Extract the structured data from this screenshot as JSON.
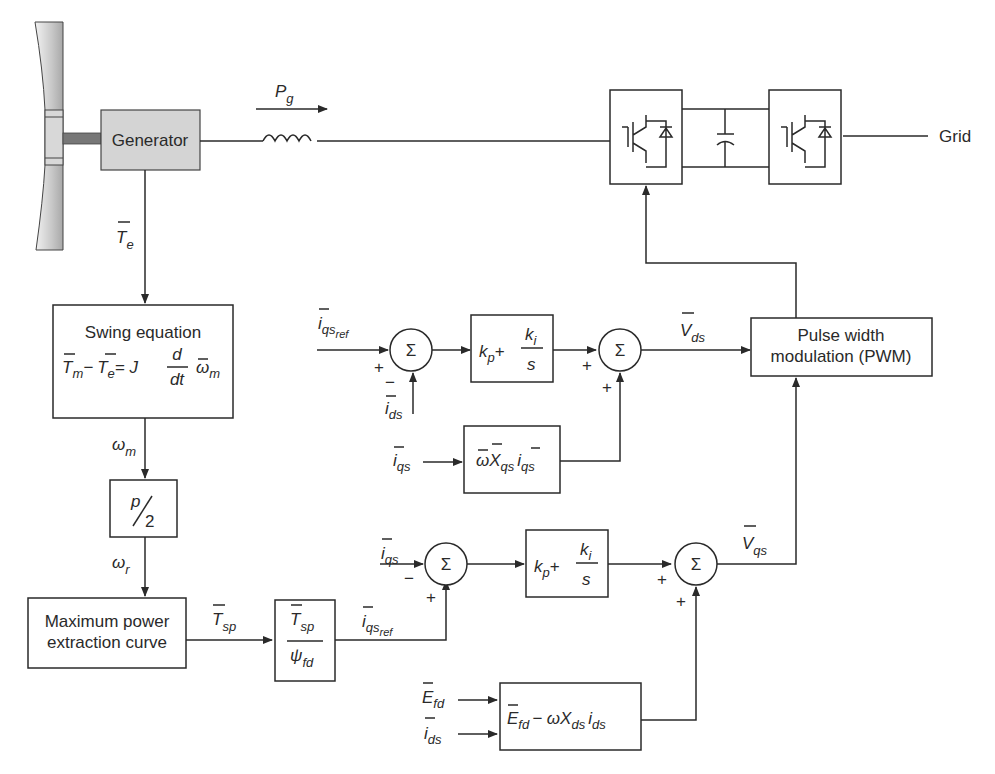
{
  "diagram": {
    "blocks": {
      "generator": "Generator",
      "swing_title": "Swing equation",
      "pole_ratio_num": "p",
      "pole_ratio_den": "2",
      "mppt_line1": "Maximum power",
      "mppt_line2": "extraction curve",
      "pwm_line1": "Pulse width",
      "pwm_line2": "modulation (PWM)",
      "grid": "Grid",
      "sum_symbol": "Σ"
    },
    "signals": {
      "pg": "P",
      "pg_sub": "g",
      "te": "T",
      "te_sub": "e",
      "wm": "ω",
      "wm_sub": "m",
      "wr": "ω",
      "wr_sub": "r",
      "tsp": "T",
      "tsp_sub": "sp",
      "psi": "ψ",
      "psi_sub": "fd",
      "iqsref": "i",
      "iqsref_sub": "qs",
      "iqsref_subsub": "ref",
      "ids": "i",
      "ids_sub": "ds",
      "iqs": "i",
      "iqs_sub": "qs",
      "vds": "V",
      "vds_sub": "ds",
      "vqs": "V",
      "vqs_sub": "qs",
      "efd": "E",
      "efd_sub": "fd"
    },
    "equations": {
      "swing_lhs": "T",
      "swing_m": "m",
      "swing_minus": "−",
      "swing_e": "e",
      "swing_eq": "= J",
      "swing_d": "d",
      "swing_dt": "dt",
      "swing_w": "ω",
      "pi_kp": "k",
      "pi_p": "p",
      "pi_plus": "+",
      "pi_ki": "k",
      "pi_i": "i",
      "pi_s": "s",
      "cross_q": "ωX",
      "cross_q_sub": "qs",
      "cross_q_i": "i",
      "cross_d_e": "E",
      "cross_d_fd": "fd",
      "cross_d_minus": "− ωX",
      "cross_d_sub": "ds",
      "cross_d_i": "i"
    },
    "signs": {
      "plus": "+",
      "minus": "−"
    }
  }
}
